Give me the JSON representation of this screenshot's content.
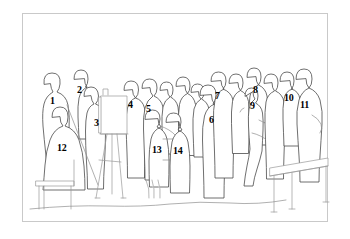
{
  "diagram": {
    "background_color": "#ffffff",
    "frame": {
      "border_color": "#c9c9c9",
      "x": 22,
      "y": 13,
      "width": 306,
      "height": 209
    },
    "line_color": "#4a4a4a",
    "secondary_line_color": "#8e8e8e",
    "label_color": "#000000",
    "figure_count": 14,
    "labels": [
      {
        "id": "figure-1",
        "text": "1",
        "x": 50,
        "y": 96,
        "role": "standing-figure-left"
      },
      {
        "id": "figure-2",
        "text": "2",
        "x": 77,
        "y": 85,
        "role": "standing-figure"
      },
      {
        "id": "figure-3",
        "text": "3",
        "x": 94,
        "y": 118,
        "role": "standing-figure"
      },
      {
        "id": "figure-4",
        "text": "4",
        "x": 128,
        "y": 100,
        "role": "standing-figure-at-easel"
      },
      {
        "id": "figure-5",
        "text": "5",
        "x": 146,
        "y": 104,
        "role": "standing-figure"
      },
      {
        "id": "figure-6",
        "text": "6",
        "x": 209,
        "y": 115,
        "role": "standing-figure-center"
      },
      {
        "id": "figure-7",
        "text": "7",
        "x": 215,
        "y": 91,
        "role": "standing-figure"
      },
      {
        "id": "figure-8",
        "text": "8",
        "x": 253,
        "y": 85,
        "role": "standing-figure"
      },
      {
        "id": "figure-9",
        "text": "9",
        "x": 250,
        "y": 101,
        "role": "standing-figure"
      },
      {
        "id": "figure-10",
        "text": "10",
        "x": 284,
        "y": 93,
        "role": "standing-figure"
      },
      {
        "id": "figure-11",
        "text": "11",
        "x": 300,
        "y": 100,
        "role": "standing-figure-right"
      },
      {
        "id": "figure-12",
        "text": "12",
        "x": 57,
        "y": 143,
        "role": "seated-figure-left"
      },
      {
        "id": "figure-13",
        "text": "13",
        "x": 152,
        "y": 145,
        "role": "seated-figure-center"
      },
      {
        "id": "figure-14",
        "text": "14",
        "x": 173,
        "y": 146,
        "role": "seated-figure-center"
      }
    ],
    "objects": [
      {
        "id": "easel",
        "name": "easel-with-canvas",
        "description": "tripod easel supporting a rectangular canvas, left of center"
      },
      {
        "id": "table",
        "name": "table",
        "description": "rectangular table at lower right"
      },
      {
        "id": "chair-left",
        "name": "chair-left",
        "description": "chair beneath seated figure 12"
      },
      {
        "id": "ground-line",
        "name": "ground-line",
        "description": "faint floor line running across the lower part of the scene"
      }
    ]
  }
}
